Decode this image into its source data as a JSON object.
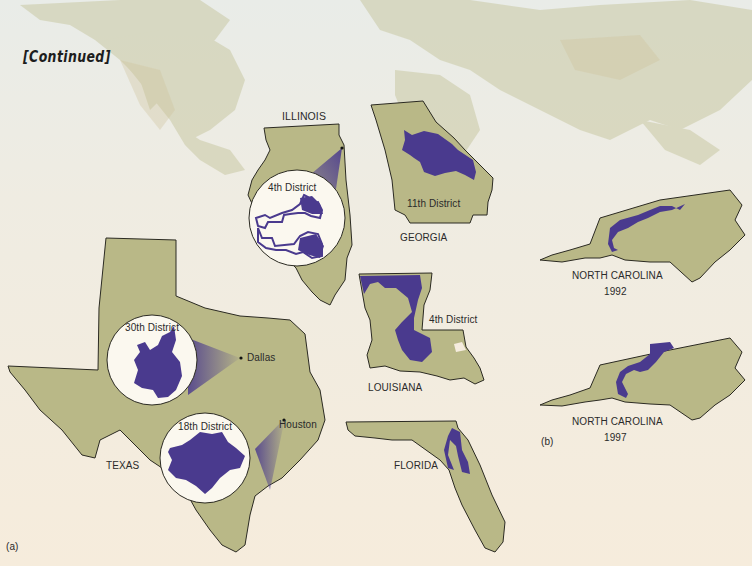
{
  "heading": "[Continued]",
  "colors": {
    "state_fill": "#b9b887",
    "state_stroke": "#2b2a22",
    "district_fill": "#4a3a8e",
    "magnifier_fill": "#fbf8ef",
    "page_bg": "#f5ecde"
  },
  "panel_a": {
    "label": "(a)",
    "states": [
      {
        "name": "ILLINOIS",
        "districts": [
          {
            "label": "4th District"
          }
        ]
      },
      {
        "name": "GEORGIA",
        "districts": [
          {
            "label": "11th District"
          }
        ]
      },
      {
        "name": "LOUISIANA",
        "districts": [
          {
            "label": "4th District"
          }
        ]
      },
      {
        "name": "TEXAS",
        "districts": [
          {
            "label": "30th District",
            "city": "Dallas"
          },
          {
            "label": "18th District",
            "city": "Houston"
          }
        ]
      },
      {
        "name": "FLORIDA",
        "districts": []
      }
    ]
  },
  "panel_b": {
    "label": "(b)",
    "maps": [
      {
        "state": "NORTH CAROLINA",
        "year": "1992"
      },
      {
        "state": "NORTH CAROLINA",
        "year": "1997"
      }
    ]
  }
}
